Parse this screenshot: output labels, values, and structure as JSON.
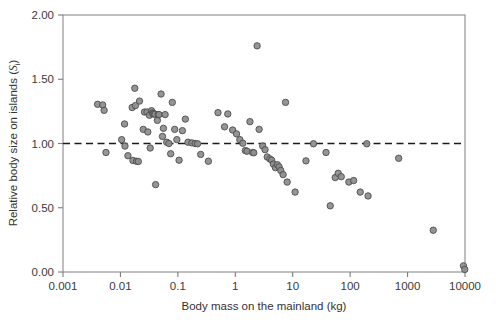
{
  "figure": {
    "background": "#ffffff",
    "marker_fill": "#8c8c8c",
    "marker_edge": "#4d4d4d",
    "axis_color": "#8a8a8a",
    "refline_color": "#1b1b1b"
  },
  "chart_data": {
    "type": "scatter",
    "title": "",
    "xlabel": "Body mass on the mainland (kg)",
    "ylabel_prefix": "Relative body size on islands (",
    "ylabel_symbol": "S",
    "ylabel_subscript": "i",
    "ylabel_suffix": ")",
    "ylabel_full": "Relative body size on islands (Si)",
    "xscale": "log",
    "yscale": "linear",
    "xlim": [
      0.001,
      10000
    ],
    "ylim": [
      0.0,
      2.0
    ],
    "xticks": [
      0.001,
      0.01,
      0.1,
      1,
      10,
      100,
      1000,
      10000
    ],
    "xtick_labels": [
      "0.001",
      "0.01",
      "0.1",
      "1",
      "10",
      "100",
      "1000",
      "10000"
    ],
    "yticks": [
      0.0,
      0.5,
      1.0,
      1.5,
      2.0
    ],
    "ytick_labels": [
      "0.00",
      "0.50",
      "1.00",
      "1.50",
      "2.00"
    ],
    "grid": false,
    "legend": null,
    "annotations": [
      {
        "type": "hline",
        "y": 1.0,
        "style": "dashed",
        "label": "no size change (Si = 1.00)"
      }
    ],
    "series": [
      {
        "name": "island species",
        "marker": "filled-circle",
        "points": [
          [
            0.004,
            1.305
          ],
          [
            0.0049,
            1.3
          ],
          [
            0.0052,
            1.258
          ],
          [
            0.0056,
            0.93
          ],
          [
            0.0105,
            1.03
          ],
          [
            0.0118,
            1.152
          ],
          [
            0.012,
            0.98
          ],
          [
            0.0135,
            0.905
          ],
          [
            0.016,
            1.28
          ],
          [
            0.0165,
            0.868
          ],
          [
            0.0178,
            1.43
          ],
          [
            0.0182,
            1.295
          ],
          [
            0.019,
            0.862
          ],
          [
            0.0205,
            0.86
          ],
          [
            0.0215,
            1.33
          ],
          [
            0.025,
            1.11
          ],
          [
            0.0262,
            1.245
          ],
          [
            0.029,
            1.245
          ],
          [
            0.03,
            1.09
          ],
          [
            0.032,
            1.22
          ],
          [
            0.033,
            0.965
          ],
          [
            0.0348,
            1.255
          ],
          [
            0.036,
            1.238
          ],
          [
            0.037,
            1.23
          ],
          [
            0.0385,
            1.232
          ],
          [
            0.04,
            1.228
          ],
          [
            0.041,
            0.68
          ],
          [
            0.044,
            1.18
          ],
          [
            0.0455,
            1.225
          ],
          [
            0.047,
            1.225
          ],
          [
            0.051,
            1.385
          ],
          [
            0.054,
            1.055
          ],
          [
            0.056,
            1.118
          ],
          [
            0.06,
            1.225
          ],
          [
            0.064,
            1.01
          ],
          [
            0.07,
            1.0
          ],
          [
            0.075,
            0.92
          ],
          [
            0.08,
            1.32
          ],
          [
            0.088,
            1.11
          ],
          [
            0.096,
            1.03
          ],
          [
            0.105,
            0.87
          ],
          [
            0.12,
            1.1
          ],
          [
            0.135,
            1.19
          ],
          [
            0.15,
            1.01
          ],
          [
            0.175,
            1.005
          ],
          [
            0.2,
            1.0
          ],
          [
            0.22,
            0.998
          ],
          [
            0.25,
            0.915
          ],
          [
            0.34,
            0.862
          ],
          [
            0.5,
            1.24
          ],
          [
            0.65,
            1.13
          ],
          [
            0.74,
            1.23
          ],
          [
            0.9,
            1.105
          ],
          [
            1.05,
            1.075
          ],
          [
            1.2,
            1.03
          ],
          [
            1.35,
            1.002
          ],
          [
            1.5,
            0.945
          ],
          [
            1.6,
            0.94
          ],
          [
            1.8,
            1.17
          ],
          [
            2.0,
            0.93
          ],
          [
            2.1,
            0.928
          ],
          [
            2.4,
            1.76
          ],
          [
            2.6,
            1.11
          ],
          [
            3.0,
            0.98
          ],
          [
            3.3,
            0.952
          ],
          [
            3.6,
            0.895
          ],
          [
            4.0,
            0.88
          ],
          [
            4.3,
            0.87
          ],
          [
            4.6,
            0.84
          ],
          [
            5.0,
            0.812
          ],
          [
            5.4,
            0.835
          ],
          [
            5.8,
            0.818
          ],
          [
            6.2,
            0.79
          ],
          [
            6.8,
            0.758
          ],
          [
            7.5,
            1.32
          ],
          [
            8.0,
            0.7
          ],
          [
            11.0,
            0.622
          ],
          [
            17.0,
            0.865
          ],
          [
            23.0,
            0.998
          ],
          [
            38.0,
            0.93
          ],
          [
            45.0,
            0.515
          ],
          [
            55.0,
            0.735
          ],
          [
            62.0,
            0.768
          ],
          [
            70.0,
            0.742
          ],
          [
            95.0,
            0.7
          ],
          [
            115.0,
            0.712
          ],
          [
            150.0,
            0.622
          ],
          [
            195.0,
            0.998
          ],
          [
            205.0,
            0.592
          ],
          [
            700.0,
            0.885
          ],
          [
            2800.0,
            0.325
          ],
          [
            9400.0,
            0.048
          ],
          [
            9900.0,
            0.02
          ]
        ]
      }
    ]
  }
}
